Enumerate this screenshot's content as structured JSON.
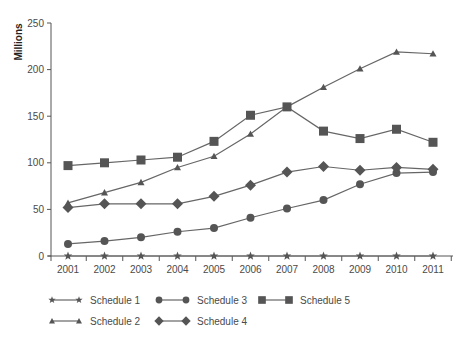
{
  "chart_data": {
    "type": "line",
    "title": "",
    "xlabel": "",
    "ylabel": "Millions",
    "ylim": [
      0,
      250
    ],
    "yticks": [
      0,
      50,
      100,
      150,
      200,
      250
    ],
    "grid": false,
    "legend_position": "bottom",
    "categories": [
      "2001",
      "2002",
      "2003",
      "2004",
      "2005",
      "2006",
      "2007",
      "2008",
      "2009",
      "2010",
      "2011"
    ],
    "series": [
      {
        "name": "Schedule 1",
        "marker": "star",
        "values": [
          0,
          0,
          0,
          0,
          0,
          0,
          0,
          0,
          0,
          0,
          0
        ]
      },
      {
        "name": "Schedule 2",
        "marker": "triangle",
        "values": [
          57,
          68,
          79,
          95,
          107,
          131,
          160,
          181,
          201,
          219,
          217
        ]
      },
      {
        "name": "Schedule 3",
        "marker": "circle",
        "values": [
          13,
          16,
          20,
          26,
          30,
          41,
          51,
          60,
          77,
          89,
          90
        ]
      },
      {
        "name": "Schedule 4",
        "marker": "diamond",
        "values": [
          52,
          56,
          56,
          56,
          64,
          76,
          90,
          96,
          92,
          95,
          93
        ]
      },
      {
        "name": "Schedule 5",
        "marker": "square",
        "values": [
          97,
          100,
          103,
          106,
          123,
          151,
          160,
          134,
          126,
          136,
          122
        ]
      }
    ]
  },
  "colors": {
    "line": "#666666",
    "marker": "#555555",
    "axis": "#555555",
    "text": "#4a4a4a"
  }
}
